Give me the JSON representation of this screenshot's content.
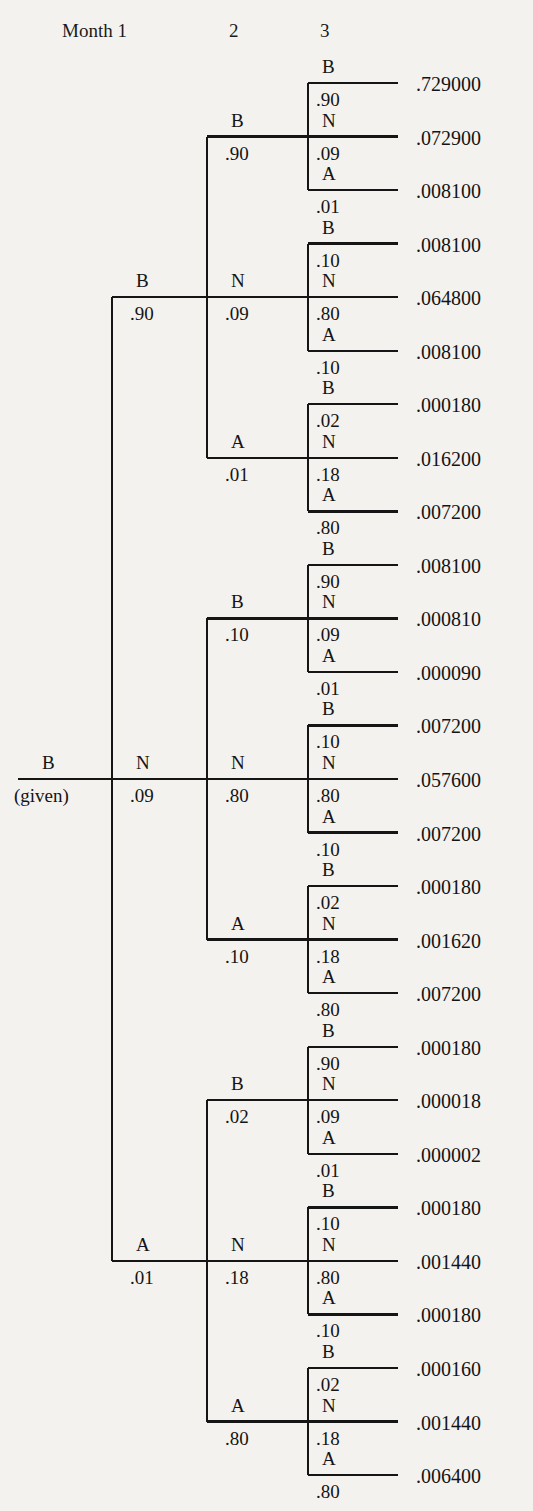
{
  "figure": {
    "type": "probability-tree",
    "title_row": [
      {
        "text": "Month 1",
        "x": 62
      },
      {
        "text": "2",
        "x": 229
      },
      {
        "text": "3",
        "x": 320
      }
    ],
    "root": {
      "label": "B",
      "sublabel": "(given)",
      "x": 18,
      "y": 779
    },
    "geometry": {
      "root_x": 18,
      "level1_x": 112,
      "level2_x": 207,
      "level3_x": 308,
      "leaf_end_x": 398,
      "value_x": 416,
      "first_leaf_y": 83,
      "leaf_spacing": 53.54,
      "line_color": "#151515",
      "line_width": 2.4,
      "bg_color": "#f4f2ee"
    },
    "level1": [
      {
        "label": "B",
        "prob": ".90"
      },
      {
        "label": "N",
        "prob": ".09"
      },
      {
        "label": "A",
        "prob": ".01"
      }
    ],
    "level2": [
      {
        "label": "B",
        "prob": ".90"
      },
      {
        "label": "N",
        "prob": ".09"
      },
      {
        "label": "A",
        "prob": ".01"
      },
      {
        "label": "B",
        "prob": ".10"
      },
      {
        "label": "N",
        "prob": ".80"
      },
      {
        "label": "A",
        "prob": ".10"
      },
      {
        "label": "B",
        "prob": ".02"
      },
      {
        "label": "N",
        "prob": ".18"
      },
      {
        "label": "A",
        "prob": ".80"
      }
    ],
    "level3": [
      {
        "label": "B",
        "prob": ".90",
        "value": ".729000"
      },
      {
        "label": "N",
        "prob": ".09",
        "value": ".072900"
      },
      {
        "label": "A",
        "prob": ".01",
        "value": ".008100"
      },
      {
        "label": "B",
        "prob": ".10",
        "value": ".008100"
      },
      {
        "label": "N",
        "prob": ".80",
        "value": ".064800"
      },
      {
        "label": "A",
        "prob": ".10",
        "value": ".008100"
      },
      {
        "label": "B",
        "prob": ".02",
        "value": ".000180"
      },
      {
        "label": "N",
        "prob": ".18",
        "value": ".016200"
      },
      {
        "label": "A",
        "prob": ".80",
        "value": ".007200"
      },
      {
        "label": "B",
        "prob": ".90",
        "value": ".008100"
      },
      {
        "label": "N",
        "prob": ".09",
        "value": ".000810"
      },
      {
        "label": "A",
        "prob": ".01",
        "value": ".000090"
      },
      {
        "label": "B",
        "prob": ".10",
        "value": ".007200"
      },
      {
        "label": "N",
        "prob": ".80",
        "value": ".057600"
      },
      {
        "label": "A",
        "prob": ".10",
        "value": ".007200"
      },
      {
        "label": "B",
        "prob": ".02",
        "value": ".000180"
      },
      {
        "label": "N",
        "prob": ".18",
        "value": ".001620"
      },
      {
        "label": "A",
        "prob": ".80",
        "value": ".007200"
      },
      {
        "label": "B",
        "prob": ".90",
        "value": ".000180"
      },
      {
        "label": "N",
        "prob": ".09",
        "value": ".000018"
      },
      {
        "label": "A",
        "prob": ".01",
        "value": ".000002"
      },
      {
        "label": "B",
        "prob": ".10",
        "value": ".000180"
      },
      {
        "label": "N",
        "prob": ".80",
        "value": ".001440"
      },
      {
        "label": "A",
        "prob": ".10",
        "value": ".000180"
      },
      {
        "label": "B",
        "prob": ".02",
        "value": ".000160"
      },
      {
        "label": "N",
        "prob": ".18",
        "value": ".001440"
      },
      {
        "label": "A",
        "prob": ".80",
        "value": ".006400"
      }
    ]
  },
  "chart_data": {
    "type": "tree",
    "root": "B (given)",
    "states": [
      "B",
      "N",
      "A"
    ],
    "branch_probabilities": {
      "from_B": {
        "B": 0.9,
        "N": 0.09,
        "A": 0.01
      },
      "from_N": {
        "B": 0.1,
        "N": 0.8,
        "A": 0.1
      },
      "from_A": {
        "B": 0.02,
        "N": 0.18,
        "A": 0.8
      }
    },
    "paths": [
      {
        "path": "B-B-B",
        "p": 0.729
      },
      {
        "path": "B-B-N",
        "p": 0.0729
      },
      {
        "path": "B-B-A",
        "p": 0.0081
      },
      {
        "path": "B-N-B",
        "p": 0.0081
      },
      {
        "path": "B-N-N",
        "p": 0.0648
      },
      {
        "path": "B-N-A",
        "p": 0.0081
      },
      {
        "path": "B-A-B",
        "p": 0.00018
      },
      {
        "path": "B-A-N",
        "p": 0.0162
      },
      {
        "path": "B-A-A",
        "p": 0.0072
      },
      {
        "path": "N-B-B",
        "p": 0.0081
      },
      {
        "path": "N-B-N",
        "p": 0.00081
      },
      {
        "path": "N-B-A",
        "p": 9e-05
      },
      {
        "path": "N-N-B",
        "p": 0.0072
      },
      {
        "path": "N-N-N",
        "p": 0.0576
      },
      {
        "path": "N-N-A",
        "p": 0.0072
      },
      {
        "path": "N-A-B",
        "p": 0.00018
      },
      {
        "path": "N-A-N",
        "p": 0.00162
      },
      {
        "path": "N-A-A",
        "p": 0.0072
      },
      {
        "path": "A-B-B",
        "p": 0.00018
      },
      {
        "path": "A-B-N",
        "p": 1.8e-05
      },
      {
        "path": "A-B-A",
        "p": 2e-06
      },
      {
        "path": "A-N-B",
        "p": 0.00018
      },
      {
        "path": "A-N-N",
        "p": 0.00144
      },
      {
        "path": "A-N-A",
        "p": 0.00018
      },
      {
        "path": "A-A-B",
        "p": 0.00016
      },
      {
        "path": "A-A-N",
        "p": 0.00144
      },
      {
        "path": "A-A-A",
        "p": 0.0064
      }
    ]
  }
}
